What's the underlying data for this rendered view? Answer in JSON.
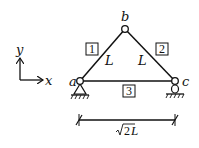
{
  "diagram": {
    "type": "truss",
    "nodes": [
      {
        "id": "a",
        "label": "a",
        "x": 80,
        "y": 81,
        "support": "pin"
      },
      {
        "id": "b",
        "label": "b",
        "x": 125,
        "y": 29,
        "support": "none"
      },
      {
        "id": "c",
        "label": "c",
        "x": 175,
        "y": 81,
        "support": "roller"
      }
    ],
    "members": [
      {
        "id": "1",
        "label": "1",
        "from": "a",
        "to": "b",
        "length_label": "L"
      },
      {
        "id": "2",
        "label": "2",
        "from": "b",
        "to": "c",
        "length_label": "L"
      },
      {
        "id": "3",
        "label": "3",
        "from": "a",
        "to": "c",
        "length_label": ""
      }
    ],
    "axes": {
      "x_label": "x",
      "y_label": "y"
    },
    "dimension": {
      "label_radical": "2",
      "label_suffix": "L",
      "label_full": "√2L"
    },
    "colors": {
      "line": "#111111",
      "background": "#ffffff"
    }
  }
}
